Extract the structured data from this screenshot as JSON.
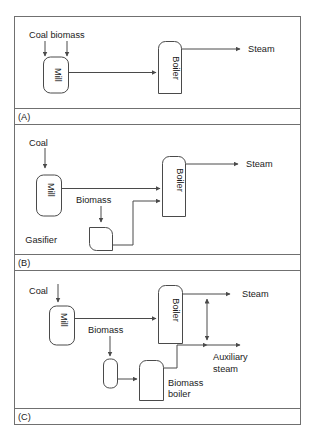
{
  "figure": {
    "title_visible": false,
    "panels": [
      {
        "tag": "(A)",
        "tag_name": "panel-tag-a",
        "inputs": [
          "Coal biomass"
        ],
        "units": [
          "Mill",
          "Boiler"
        ],
        "outputs": [
          "Steam"
        ],
        "stream_labels": []
      },
      {
        "tag": "(B)",
        "tag_name": "panel-tag-b",
        "inputs": [
          "Coal"
        ],
        "units": [
          "Mill",
          "Boiler",
          "Gasifier"
        ],
        "outputs": [
          "Steam"
        ],
        "stream_labels": [
          "Biomass"
        ]
      },
      {
        "tag": "(C)",
        "tag_name": "panel-tag-c",
        "inputs": [
          "Coal"
        ],
        "units": [
          "Mill",
          "Boiler",
          "Biomass boiler"
        ],
        "outputs": [
          "Steam",
          "Auxiliary steam"
        ],
        "stream_labels": [
          "Biomass"
        ]
      }
    ]
  },
  "panel_a": {
    "tag": "(A)",
    "input_label": "Coal biomass",
    "mill_label": "Mill",
    "boiler_label": "Boiler",
    "steam_label": "Steam"
  },
  "panel_b": {
    "tag": "(B)",
    "input_label": "Coal",
    "mill_label": "Mill",
    "biomass_label": "Biomass",
    "gasifier_label": "Gasifier",
    "boiler_label": "Boiler",
    "steam_label": "Steam"
  },
  "panel_c": {
    "tag": "(C)",
    "input_label": "Coal",
    "mill_label": "Mill",
    "biomass_label": "Biomass",
    "boiler_label": "Boiler",
    "biomass_boiler_label_line1": "Biomass",
    "biomass_boiler_label_line2": "boiler",
    "steam_label": "Steam",
    "aux_steam_label_line1": "Auxiliary",
    "aux_steam_label_line2": "steam"
  },
  "colors": {
    "background": "#ffffff",
    "frame_stroke": "#707070",
    "shape_stroke": "#4a4a4a",
    "text": "#1a1a1a"
  }
}
